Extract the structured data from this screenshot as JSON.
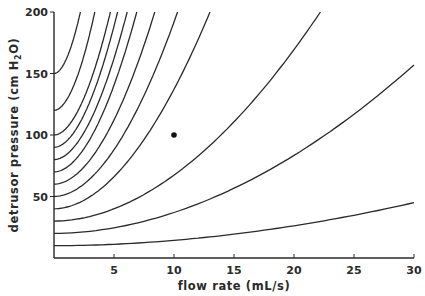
{
  "chart_data": {
    "type": "line",
    "title": "",
    "xlabel": "flow rate (mL/s)",
    "ylabel": "detrusor pressure (cm H2O)",
    "ylabel_parts": {
      "main": "detrusor pressure (cm H",
      "sub": "2",
      "tail": "O)"
    },
    "xlim": [
      0,
      30
    ],
    "ylim": [
      0,
      200
    ],
    "x_ticks": [
      5,
      10,
      15,
      20,
      25,
      30
    ],
    "y_ticks": [
      50,
      100,
      150,
      200
    ],
    "x_tick_labels": [
      "5",
      "10",
      "15",
      "20",
      "25",
      "30"
    ],
    "y_tick_labels": [
      "50",
      "100",
      "150",
      "200"
    ],
    "grid": false,
    "legend": null,
    "series": [
      {
        "name": "curve-1",
        "intercept": 150,
        "x_at_200": 2.2
      },
      {
        "name": "curve-2",
        "intercept": 120,
        "x_at_200": 3.4
      },
      {
        "name": "curve-3",
        "intercept": 100,
        "x_at_200": 4.7
      },
      {
        "name": "curve-4",
        "intercept": 90,
        "x_at_200": 5.3
      },
      {
        "name": "curve-5",
        "intercept": 80,
        "x_at_200": 6.1
      },
      {
        "name": "curve-6",
        "intercept": 70,
        "x_at_200": 6.9
      },
      {
        "name": "curve-7",
        "intercept": 60,
        "x_at_200": 8.4
      },
      {
        "name": "curve-8",
        "intercept": 50,
        "x_at_200": 10.3
      },
      {
        "name": "curve-9",
        "intercept": 40,
        "x_at_200": 13.0
      },
      {
        "name": "curve-10",
        "intercept": 30,
        "x_at_200": 22.2
      },
      {
        "name": "curve-11",
        "intercept": 20,
        "x_end": 30,
        "y_end": 157
      },
      {
        "name": "curve-12",
        "intercept": 10,
        "x_end": 30,
        "y_end": 45
      }
    ],
    "points": [
      {
        "x": 10,
        "y": 100,
        "label": ""
      }
    ]
  }
}
